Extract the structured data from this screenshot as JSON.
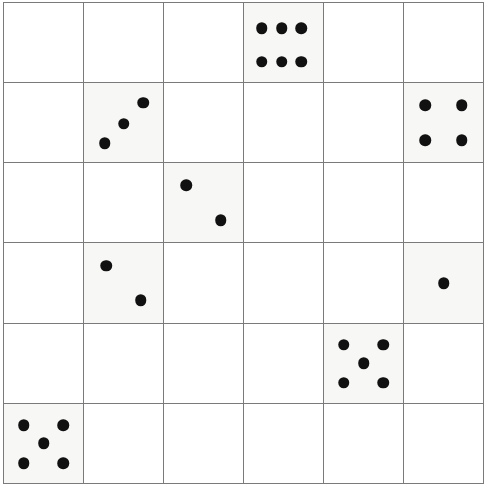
{
  "board": {
    "name": "dice-grid-puzzle",
    "rows": 6,
    "columns": 6,
    "cell_size_px": 80,
    "grid_line_color": "#7a7a7a",
    "empty_cell_color": "#ffffff",
    "die_cell_color": "#f7f7f5",
    "pip_color": "#111111"
  },
  "cells": [
    {
      "row": 1,
      "col": 1,
      "value": null,
      "face": "empty"
    },
    {
      "row": 1,
      "col": 2,
      "value": null,
      "face": "empty"
    },
    {
      "row": 1,
      "col": 3,
      "value": null,
      "face": "empty"
    },
    {
      "row": 1,
      "col": 4,
      "value": 6,
      "face": "six"
    },
    {
      "row": 1,
      "col": 5,
      "value": null,
      "face": "empty"
    },
    {
      "row": 1,
      "col": 6,
      "value": null,
      "face": "empty"
    },
    {
      "row": 2,
      "col": 1,
      "value": null,
      "face": "empty"
    },
    {
      "row": 2,
      "col": 2,
      "value": 3,
      "face": "three"
    },
    {
      "row": 2,
      "col": 3,
      "value": null,
      "face": "empty"
    },
    {
      "row": 2,
      "col": 4,
      "value": null,
      "face": "empty"
    },
    {
      "row": 2,
      "col": 5,
      "value": null,
      "face": "empty"
    },
    {
      "row": 2,
      "col": 6,
      "value": 4,
      "face": "four"
    },
    {
      "row": 3,
      "col": 1,
      "value": null,
      "face": "empty"
    },
    {
      "row": 3,
      "col": 2,
      "value": null,
      "face": "empty"
    },
    {
      "row": 3,
      "col": 3,
      "value": 2,
      "face": "two"
    },
    {
      "row": 3,
      "col": 4,
      "value": null,
      "face": "empty"
    },
    {
      "row": 3,
      "col": 5,
      "value": null,
      "face": "empty"
    },
    {
      "row": 3,
      "col": 6,
      "value": null,
      "face": "empty"
    },
    {
      "row": 4,
      "col": 1,
      "value": null,
      "face": "empty"
    },
    {
      "row": 4,
      "col": 2,
      "value": 2,
      "face": "two"
    },
    {
      "row": 4,
      "col": 3,
      "value": null,
      "face": "empty"
    },
    {
      "row": 4,
      "col": 4,
      "value": null,
      "face": "empty"
    },
    {
      "row": 4,
      "col": 5,
      "value": null,
      "face": "empty"
    },
    {
      "row": 4,
      "col": 6,
      "value": 1,
      "face": "one"
    },
    {
      "row": 5,
      "col": 1,
      "value": null,
      "face": "empty"
    },
    {
      "row": 5,
      "col": 2,
      "value": null,
      "face": "empty"
    },
    {
      "row": 5,
      "col": 3,
      "value": null,
      "face": "empty"
    },
    {
      "row": 5,
      "col": 4,
      "value": null,
      "face": "empty"
    },
    {
      "row": 5,
      "col": 5,
      "value": 5,
      "face": "five"
    },
    {
      "row": 5,
      "col": 6,
      "value": null,
      "face": "empty"
    },
    {
      "row": 6,
      "col": 1,
      "value": 5,
      "face": "five"
    },
    {
      "row": 6,
      "col": 2,
      "value": null,
      "face": "empty"
    },
    {
      "row": 6,
      "col": 3,
      "value": null,
      "face": "empty"
    },
    {
      "row": 6,
      "col": 4,
      "value": null,
      "face": "empty"
    },
    {
      "row": 6,
      "col": 5,
      "value": null,
      "face": "empty"
    },
    {
      "row": 6,
      "col": 6,
      "value": null,
      "face": "empty"
    }
  ]
}
